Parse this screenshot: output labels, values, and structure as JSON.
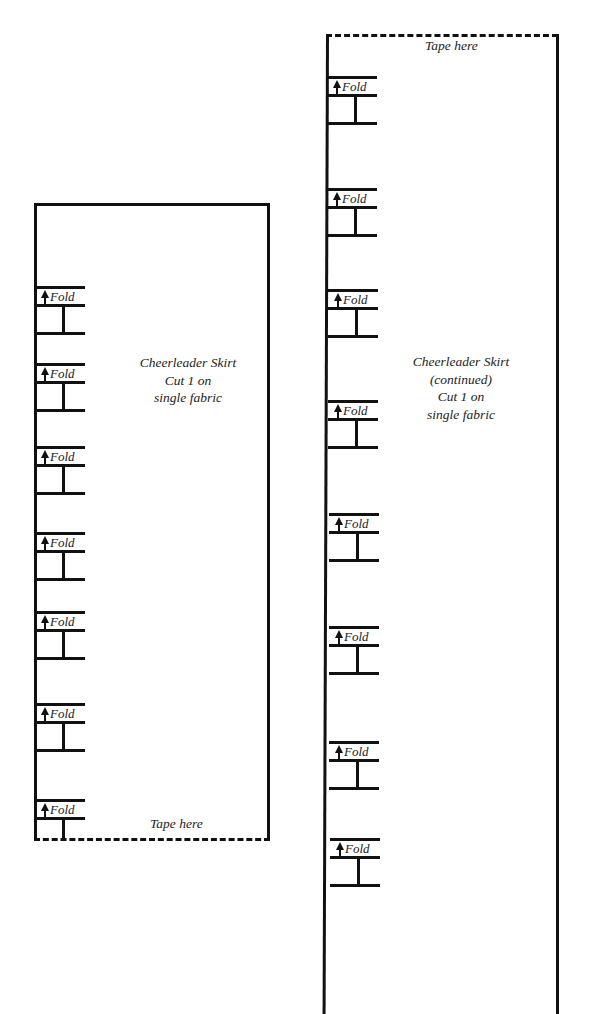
{
  "left_piece": {
    "title_lines": [
      "Cheerleader Skirt",
      "Cut 1 on",
      "single fabric"
    ],
    "tape_label": "Tape here",
    "fold_label": "Fold",
    "fold_markers_count": 7
  },
  "right_piece": {
    "title_lines": [
      "Cheerleader Skirt",
      "(continued)",
      "Cut 1 on",
      "single fabric"
    ],
    "tape_label": "Tape here",
    "fold_label": "Fold",
    "fold_markers_count": 8
  },
  "icons": {
    "fold_arrow": "arrow-up-icon"
  },
  "colors": {
    "line": "#111111",
    "text": "#222222",
    "background": "#ffffff"
  }
}
